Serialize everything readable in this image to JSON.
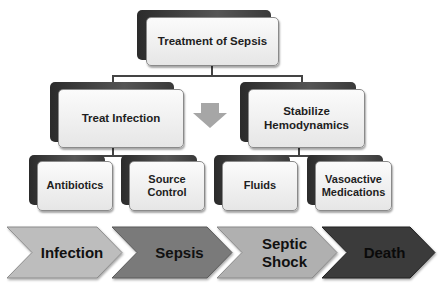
{
  "diagram": {
    "root": {
      "label": "Treatment of Sepsis"
    },
    "branches": [
      {
        "label": "Treat Infection",
        "children": [
          {
            "label": "Antibiotics"
          },
          {
            "label": "Source Control"
          }
        ]
      },
      {
        "label": "Stabilize Hemodynamics",
        "children": [
          {
            "label": "Fluids"
          },
          {
            "label": "Vasoactive Medications"
          }
        ]
      }
    ],
    "arrow": {
      "icon": "down-arrow-icon",
      "color": "#a6a6a6"
    },
    "progression": [
      {
        "label": "Infection",
        "color": "#bdbdbd"
      },
      {
        "label": "Sepsis",
        "color": "#7a7a7a"
      },
      {
        "label": "Septic Shock",
        "color": "#b0b0b0"
      },
      {
        "label": "Death",
        "color": "#3a3a3a"
      }
    ]
  }
}
